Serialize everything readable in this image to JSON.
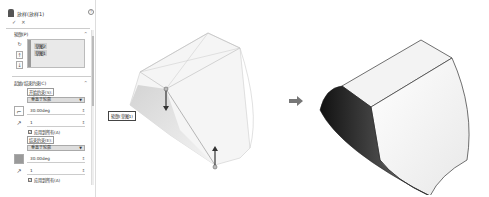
{
  "panel": {
    "title": "放样(放样1)",
    "help_icon": "question-circle-icon",
    "ok_icon": "checkmark-icon",
    "cancel_icon": "close-x-icon",
    "profiles_section": {
      "header": "轮廓(P)",
      "items": [
        "草图2",
        "草图1"
      ]
    },
    "constraints_section": {
      "header": "起始/结束约束(C)",
      "start": {
        "label": "开始约束(S):",
        "type": "垂直于轮廓",
        "angle": "30.00deg",
        "length": "1",
        "apply_all": "应用到所有(A)"
      },
      "end": {
        "label": "结束约束(E):",
        "type": "垂直于轮廓",
        "angle": "30.00deg",
        "length": "1",
        "apply_all": "应用到所有(A)"
      }
    }
  },
  "viewport": {
    "callout_label": "轮廓(草图1)"
  },
  "colors": {
    "panel_bg": "#ffffff",
    "selection_gray": "#d0d0d0",
    "arrow_gray": "#777777"
  }
}
